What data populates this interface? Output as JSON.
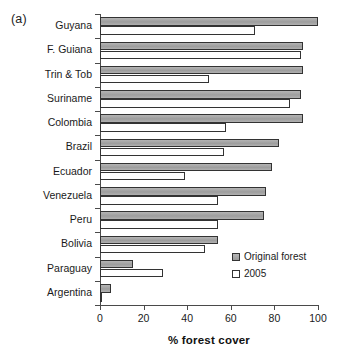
{
  "figure": {
    "panel_label": "(a)"
  },
  "legend": {
    "position": "inside-bottom-right",
    "entries": [
      {
        "label": "Original forest",
        "swatch": "gray-filled-swatch"
      },
      {
        "label": "2005",
        "swatch": "white-open-swatch"
      }
    ]
  },
  "chart_data": {
    "type": "bar",
    "orientation": "horizontal",
    "title": "",
    "subtitle": "",
    "xlabel": "% forest cover",
    "ylabel": "",
    "xlim": [
      0,
      100
    ],
    "xticks": [
      0,
      20,
      40,
      60,
      80,
      100
    ],
    "xticklabels": [
      "0",
      "20",
      "40",
      "60",
      "80",
      "100"
    ],
    "grid": false,
    "categories": [
      "Guyana",
      "F. Guiana",
      "Trin & Tob",
      "Suriname",
      "Colombia",
      "Brazil",
      "Ecuador",
      "Venezuela",
      "Peru",
      "Bolivia",
      "Paraguay",
      "Argentina"
    ],
    "series": [
      {
        "name": "Original forest",
        "values": [
          100,
          93,
          93,
          92,
          93,
          82,
          79,
          76,
          75,
          54,
          15,
          5
        ]
      },
      {
        "name": "2005",
        "values": [
          71,
          92,
          50,
          87,
          58,
          57,
          39,
          54,
          54,
          48,
          29,
          1
        ]
      }
    ]
  }
}
